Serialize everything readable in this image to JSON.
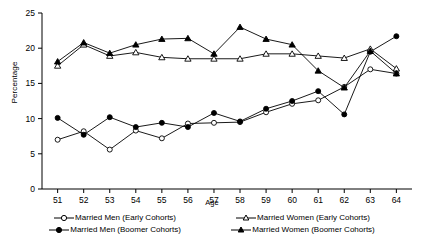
{
  "chart_data": {
    "type": "line",
    "title": "",
    "xlabel": "Age",
    "ylabel": "Percentage",
    "xlim": [
      50.4,
      64.6
    ],
    "ylim": [
      0,
      25
    ],
    "ytick_step": 5,
    "grid": false,
    "legend_position": "bottom",
    "categories": [
      51,
      52,
      53,
      54,
      55,
      56,
      57,
      58,
      59,
      60,
      61,
      62,
      63,
      64
    ],
    "x": [
      51,
      52,
      53,
      54,
      55,
      56,
      57,
      58,
      59,
      60,
      61,
      62,
      63,
      64
    ],
    "yticks": [
      0,
      5,
      10,
      15,
      20,
      25
    ],
    "ytick_labels": [
      "0",
      "5",
      "10",
      "15",
      "20",
      "25"
    ],
    "xtick_labels": [
      "51",
      "52",
      "53",
      "54",
      "55",
      "56",
      "57",
      "58",
      "59",
      "60",
      "61",
      "62",
      "63",
      "64"
    ],
    "series": [
      {
        "name": "Married Men (Early Cohorts)",
        "marker": "open-circle",
        "values": [
          7.0,
          8.2,
          5.6,
          8.3,
          7.2,
          9.3,
          9.4,
          9.5,
          10.9,
          12.1,
          12.6,
          14.5,
          17.0,
          16.4
        ]
      },
      {
        "name": "Married Men (Boomer Cohorts)",
        "marker": "filled-circle",
        "values": [
          10.1,
          7.7,
          10.2,
          8.8,
          9.4,
          8.8,
          10.8,
          9.6,
          11.4,
          12.5,
          13.9,
          10.6,
          19.5,
          21.7
        ]
      },
      {
        "name": "Married Women (Early Cohorts)",
        "marker": "open-triangle",
        "values": [
          17.5,
          20.5,
          18.9,
          19.4,
          18.7,
          18.5,
          18.5,
          18.5,
          19.2,
          19.2,
          18.9,
          18.6,
          19.9,
          17.1
        ]
      },
      {
        "name": "Married Women (Boomer Cohorts)",
        "marker": "filled-triangle",
        "values": [
          18.1,
          20.8,
          19.3,
          20.5,
          21.3,
          21.4,
          19.2,
          23.0,
          21.3,
          20.5,
          16.8,
          14.4,
          19.6,
          16.4
        ]
      }
    ],
    "colors": {
      "line": "#000000",
      "axis": "#000000",
      "background": "#ffffff"
    }
  },
  "legend": {
    "items": [
      "Married Men (Early Cohorts)",
      "Married Women (Early Cohorts)",
      "Married Men (Boomer Cohorts)",
      "Married Women (Boomer Cohorts)"
    ]
  },
  "axes": {
    "y_title": "Percentage",
    "x_title": "Age"
  }
}
